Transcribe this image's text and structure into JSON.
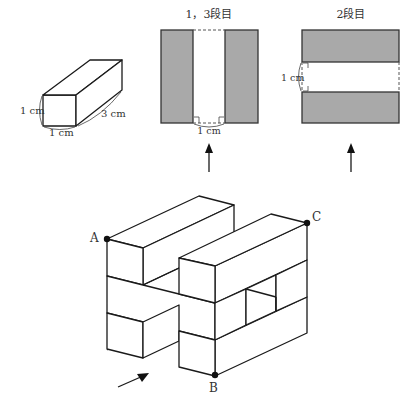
{
  "prism": {
    "label_height": "1 cm",
    "label_width": "1 cm",
    "label_length": "3 cm"
  },
  "top_view_1_3": {
    "title": "1，3段目",
    "gap_label": "1 cm"
  },
  "top_view_2": {
    "title": "2段目",
    "gap_label": "1 cm"
  },
  "solid": {
    "point_a": "A",
    "point_b": "B",
    "point_c": "C"
  },
  "colors": {
    "shaded_block": "#a9a9a9",
    "line": "#1a1a1a"
  }
}
